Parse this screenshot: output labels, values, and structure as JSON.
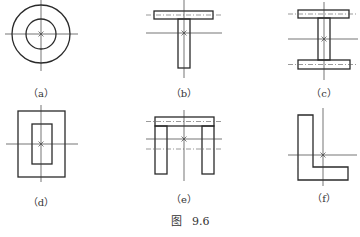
{
  "figure": {
    "title": "图   9.6",
    "panels": [
      {
        "id": "a",
        "caption": "（a）",
        "shape": "concentric circles (tube section)"
      },
      {
        "id": "b",
        "caption": "（b）",
        "shape": "T-section"
      },
      {
        "id": "c",
        "caption": "（c）",
        "shape": "I-section"
      },
      {
        "id": "d",
        "caption": "（d）",
        "shape": "rectangular hollow section"
      },
      {
        "id": "e",
        "caption": "（e）",
        "shape": "channel / Π-section"
      },
      {
        "id": "f",
        "caption": "（f）",
        "shape": "L-section (angle)"
      }
    ]
  },
  "colors": {
    "line": "#2a2a2a",
    "background": "#ffffff"
  }
}
